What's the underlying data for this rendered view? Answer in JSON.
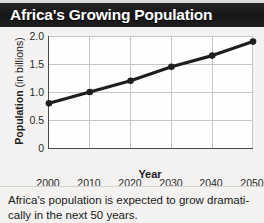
{
  "title": "Africa's Growing Population",
  "caption": {
    "line1": "Africa's population is expected to grow dramati-",
    "line2": "cally in the next 50 years."
  },
  "chart_data": {
    "type": "line",
    "title": "Africa's Growing Population",
    "xlabel": "Year",
    "ylabel": "Population (in billions)",
    "x": [
      2000,
      2010,
      2020,
      2030,
      2040,
      2050
    ],
    "categories": [
      "2000",
      "2010",
      "2020",
      "2030",
      "2040",
      "2050"
    ],
    "values": [
      0.8,
      1.0,
      1.2,
      1.45,
      1.65,
      1.9
    ],
    "series": [
      {
        "name": "Population",
        "values": [
          0.8,
          1.0,
          1.2,
          1.45,
          1.65,
          1.9
        ]
      }
    ],
    "xlim": [
      2000,
      2050
    ],
    "ylim": [
      0,
      2.0
    ],
    "yticks": [
      "0",
      "0.5",
      "1.0",
      "1.5",
      "2.0"
    ],
    "ytick_values": [
      0,
      0.5,
      1.0,
      1.5,
      2.0
    ],
    "xticks": [
      "2000",
      "2010",
      "2020",
      "2030",
      "2040",
      "2050"
    ],
    "grid": true,
    "legend": false,
    "line_color": "#1f1f1f",
    "marker": "circle",
    "plot_background": "#ffffff"
  },
  "colors": {
    "title_bar": "#1b1b1b",
    "title_text": "#ffffff",
    "page_background": "#f4f3f1",
    "axis": "#4a4a4a",
    "grid": "#c9c8c6",
    "text": "#1d1d1d"
  }
}
